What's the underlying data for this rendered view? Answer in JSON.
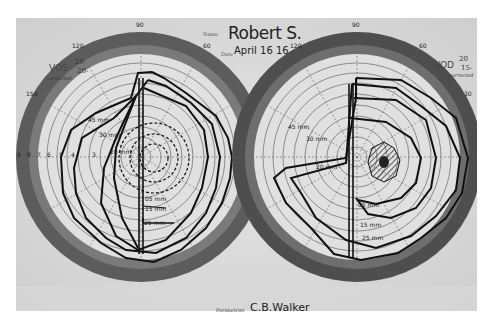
{
  "header": {
    "name_label": "Name",
    "patient_name": "Robert S.",
    "date_label": "Date",
    "date_value": "April 16 16"
  },
  "left_eye": {
    "label": "VOS",
    "acuity_numerator": "20",
    "acuity_denominator": "20-",
    "note": "corrected",
    "meridian_top": "90",
    "meridian_upper_left": "120",
    "meridian_upper_right": "60",
    "meridian_left": "150",
    "horizontal_ticks": [
      "9",
      "8",
      "7",
      "6",
      "5",
      "4",
      "3",
      "2",
      "1"
    ],
    "isopter_labels": [
      "45 mm",
      "30 mm",
      "20 mm",
      "05 mm",
      "15 mm",
      "25 mm"
    ],
    "blind_spot": "physiologic"
  },
  "right_eye": {
    "label": "VOD",
    "acuity_numerator": "20",
    "acuity_denominator": "15-",
    "note": "corrected",
    "meridian_top": "90",
    "meridian_upper_left": "120",
    "meridian_upper_right": "60",
    "meridian_right": "30",
    "horizontal_ticks": [
      "6",
      "5",
      "4",
      "3",
      "2",
      "1",
      "2",
      "3",
      "4",
      "5",
      "6",
      "7",
      "8"
    ],
    "isopter_labels": [
      "45 mm",
      "30 mm",
      "20 mm",
      "05 mm",
      "15 mm",
      "25 mm"
    ],
    "scotoma": "hatched central scotoma"
  },
  "footer": {
    "perimetrist_label": "Perimetrist",
    "perimetrist_name": "C.B.Walker"
  },
  "colors": {
    "paper": "#dcdcdc",
    "band": "#5a5a5a",
    "ink": "#111111",
    "grid": "#666666"
  }
}
